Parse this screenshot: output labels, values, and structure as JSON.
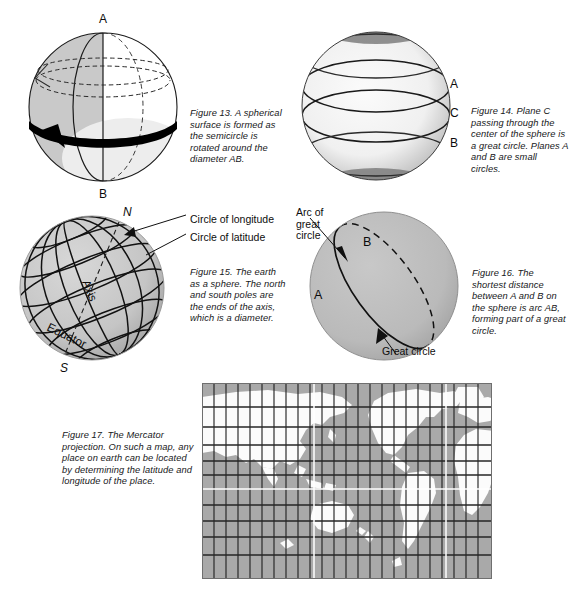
{
  "page": {
    "background_color": "#ffffff",
    "text_color": "#17181a"
  },
  "figures": [
    {
      "id": "figure-13",
      "number": "Figure 13.",
      "caption": "Figure 13. A spherical surface is formed as the semicircle is rotated around the diameter AB.",
      "labels": [
        {
          "name": "pole-a-label",
          "text": "A"
        },
        {
          "name": "pole-b-label",
          "text": "B"
        }
      ],
      "sphere": {
        "fill_left": "#c9c9c9",
        "fill_right": "#ffffff",
        "outline": "#1a1a1a",
        "band_color": "#000000"
      }
    },
    {
      "id": "figure-14",
      "number": "Figure 14.",
      "caption": "Figure 14. Plane C passing through the center of the sphere is a great circle. Planes A and B are small circles.",
      "labels": [
        {
          "name": "plane-a-label",
          "text": "A"
        },
        {
          "name": "plane-c-label",
          "text": "C"
        },
        {
          "name": "plane-b-label",
          "text": "B"
        }
      ],
      "sphere": {
        "fill": "#f2f2f2",
        "shade": "#8c8c8c",
        "outline": "#1a1a1a"
      }
    },
    {
      "id": "figure-15",
      "number": "Figure 15.",
      "caption": "Figure 15. The earth as a sphere. The north and south poles are the ends of the axis, which is a diameter.",
      "labels": [
        {
          "name": "north-pole-label",
          "text": "N"
        },
        {
          "name": "south-pole-label",
          "text": "S"
        },
        {
          "name": "axis-label",
          "text": "Axis"
        },
        {
          "name": "equator-label",
          "text": "Equator"
        }
      ],
      "callouts": [
        {
          "name": "circle-of-longitude-callout",
          "text": "Circle of longitude"
        },
        {
          "name": "circle-of-latitude-callout",
          "text": "Circle of latitude"
        }
      ],
      "sphere": {
        "fill": "#c6c6c6",
        "outline": "#121212"
      }
    },
    {
      "id": "figure-16",
      "number": "Figure 16.",
      "caption": "Figure 16. The shortest distance between A and B on the sphere is arc AB, forming part of a great circle.",
      "labels": [
        {
          "name": "point-a-label",
          "text": "A"
        },
        {
          "name": "point-b-label",
          "text": "B"
        }
      ],
      "callouts": [
        {
          "name": "arc-of-great-circle-callout",
          "text": "Arc of great circle"
        },
        {
          "name": "great-circle-callout",
          "text": "Great circle"
        }
      ],
      "sphere": {
        "fill": "#b9b9b9",
        "outline": "#111111"
      }
    },
    {
      "id": "figure-17",
      "number": "Figure 17.",
      "caption": "Figure 17. The Mercator projection. On such a map, any place on earth can be located by determining the latitude and longitude of the place.",
      "map": {
        "ocean_color": "#a9a9a9",
        "land_color": "#fbfbfb",
        "grid_color": "#262626",
        "highlight_line_color": "#ffffff",
        "grid_columns": 24,
        "grid_rows": 12,
        "equator_marked": true,
        "prime_meridian_marked": true
      }
    }
  ]
}
